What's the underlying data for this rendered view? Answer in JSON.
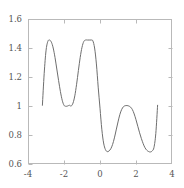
{
  "top_artifact": {
    "text": "",
    "visible": false
  },
  "chart_data": {
    "type": "line",
    "title": "",
    "subtitle": "",
    "xlabel": "",
    "ylabel": "",
    "xlim": [
      -4,
      4
    ],
    "ylim": [
      0.6,
      1.6
    ],
    "xticks": [
      -4,
      -2,
      0,
      2,
      4
    ],
    "xtick_labels": [
      "-4",
      "-2",
      "0",
      "2",
      "4"
    ],
    "yticks": [
      0.6,
      0.8,
      1.0,
      1.2,
      1.4,
      1.6
    ],
    "ytick_labels": [
      "0.6",
      "0.8",
      "1",
      "1.2",
      "1.4",
      "1.6"
    ],
    "grid": false,
    "legend": false,
    "legend_position": "none",
    "frame": true,
    "line_color": "#6e6e6e",
    "line_width": 1.0,
    "axis_color": "#b9b9b9",
    "background": "#ffffff",
    "series": [
      {
        "name": "curve",
        "x": [
          -3.2,
          -3.1,
          -3.0,
          -2.9,
          -2.8,
          -2.7,
          -2.6,
          -2.5,
          -2.4,
          -2.3,
          -2.2,
          -2.1,
          -2.0,
          -1.9,
          -1.8,
          -1.7,
          -1.6,
          -1.5,
          -1.4,
          -1.3,
          -1.2,
          -1.1,
          -1.0,
          -0.9,
          -0.8,
          -0.7,
          -0.6,
          -0.5,
          -0.4,
          -0.3,
          -0.2,
          -0.1,
          0.0,
          0.1,
          0.2,
          0.3,
          0.4,
          0.5,
          0.6,
          0.7,
          0.8,
          0.9,
          1.0,
          1.1,
          1.2,
          1.3,
          1.4,
          1.5,
          1.6,
          1.7,
          1.8,
          1.9,
          2.0,
          2.1,
          2.2,
          2.3,
          2.4,
          2.5,
          2.6,
          2.7,
          2.8,
          2.9,
          3.0,
          3.1,
          3.2
        ],
        "y": [
          1.005,
          1.225,
          1.38,
          1.445,
          1.455,
          1.44,
          1.4,
          1.335,
          1.255,
          1.175,
          1.1,
          1.04,
          1.005,
          0.998,
          1.0,
          1.005,
          1.0,
          1.02,
          1.07,
          1.15,
          1.245,
          1.335,
          1.405,
          1.445,
          1.455,
          1.455,
          1.455,
          1.455,
          1.45,
          1.4,
          1.29,
          1.13,
          0.985,
          0.84,
          0.745,
          0.7,
          0.685,
          0.69,
          0.705,
          0.735,
          0.78,
          0.835,
          0.89,
          0.94,
          0.975,
          0.995,
          1.002,
          1.003,
          1.0,
          0.992,
          0.975,
          0.945,
          0.905,
          0.86,
          0.815,
          0.775,
          0.74,
          0.712,
          0.695,
          0.686,
          0.683,
          0.69,
          0.715,
          0.81,
          1.005
        ]
      }
    ],
    "annotations": [
      {
        "label": "left peak",
        "x": -2.8,
        "y": 1.455
      },
      {
        "label": "middle valley",
        "x": -1.8,
        "y": 1.0
      },
      {
        "label": "second peak",
        "x": -0.55,
        "y": 1.455
      },
      {
        "label": "deep valley left",
        "x": 0.4,
        "y": 0.685
      },
      {
        "label": "local max right",
        "x": 1.55,
        "y": 1.003
      },
      {
        "label": "deep valley right",
        "x": 2.8,
        "y": 0.683
      }
    ]
  },
  "plot_geometry": {
    "left_px": 28,
    "right_px": 172,
    "top_px": 19,
    "bottom_px": 164
  }
}
